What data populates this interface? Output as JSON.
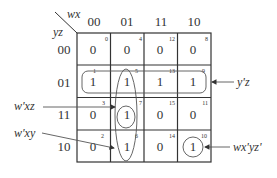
{
  "kmap": {
    "col_var": "wx",
    "row_var": "yz",
    "col_labels": [
      "00",
      "01",
      "11",
      "10"
    ],
    "row_labels": [
      "00",
      "01",
      "11",
      "10"
    ],
    "cells": [
      [
        {
          "value": "0",
          "index": "0"
        },
        {
          "value": "0",
          "index": "4"
        },
        {
          "value": "0",
          "index": "12"
        },
        {
          "value": "0",
          "index": "8"
        }
      ],
      [
        {
          "value": "1",
          "index": "1"
        },
        {
          "value": "1",
          "index": "5"
        },
        {
          "value": "1",
          "index": "13"
        },
        {
          "value": "1",
          "index": "9"
        }
      ],
      [
        {
          "value": "0",
          "index": "3"
        },
        {
          "value": "1",
          "index": "7"
        },
        {
          "value": "0",
          "index": "15"
        },
        {
          "value": "0",
          "index": "11"
        }
      ],
      [
        {
          "value": "0",
          "index": "2"
        },
        {
          "value": "1",
          "index": "6"
        },
        {
          "value": "0",
          "index": "14"
        },
        {
          "value": "1",
          "index": "10"
        }
      ]
    ]
  },
  "annotations": {
    "yz_group": "y'z",
    "wxz_group": "w'xz",
    "wxy_group": "w'xy",
    "single_group": "wx'yz'"
  }
}
